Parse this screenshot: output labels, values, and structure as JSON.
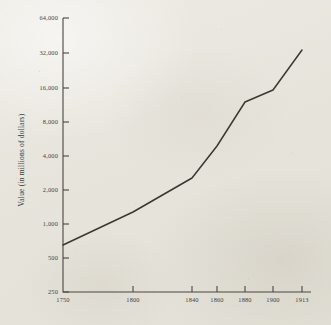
{
  "chart_data": {
    "type": "line",
    "title": "",
    "xlabel": "",
    "ylabel": "Value (in millions of dollars)",
    "yscale": "log",
    "ylim": [
      250,
      64000
    ],
    "grid": false,
    "legend": null,
    "x_tick_labels": [
      "1750",
      "1800",
      "1840",
      "1860",
      "1880",
      "1900",
      "1913"
    ],
    "y_tick_labels": [
      "250",
      "500",
      "1,000",
      "2,000",
      "4,000",
      "8,000",
      "16,000",
      "32,000",
      "64,000"
    ],
    "y_tick_values": [
      250,
      500,
      1000,
      2000,
      4000,
      8000,
      16000,
      32000,
      64000
    ],
    "x": [
      1750,
      1800,
      1840,
      1860,
      1880,
      1900,
      1913
    ],
    "values": [
      700,
      1300,
      3000,
      6000,
      15000,
      20000,
      38000
    ],
    "series": [
      {
        "name": "Value",
        "points": [
          {
            "x": "1750",
            "y": 700
          },
          {
            "x": "1800",
            "y": 1300
          },
          {
            "x": "1840",
            "y": 3000
          },
          {
            "x": "1860",
            "y": 6000
          },
          {
            "x": "1880",
            "y": 15000
          },
          {
            "x": "1900",
            "y": 20000
          },
          {
            "x": "1913",
            "y": 38000
          }
        ]
      }
    ]
  },
  "colors": {
    "paper": "#e9e7e0",
    "ink": "#3b3832",
    "axis": "#4a4640"
  },
  "geometry": {
    "plot_left": 63,
    "plot_right": 311,
    "plot_top": 18,
    "plot_bottom": 292,
    "x_tick_px": [
      63,
      133,
      192,
      217,
      245,
      273,
      302
    ],
    "y_tick_px": [
      292,
      258,
      224,
      190,
      156,
      122,
      88,
      53,
      18
    ],
    "line_points_px": [
      [
        63,
        245
      ],
      [
        133,
        212
      ],
      [
        192,
        178
      ],
      [
        217,
        146
      ],
      [
        245,
        102
      ],
      [
        273,
        90
      ],
      [
        302,
        50
      ]
    ]
  }
}
